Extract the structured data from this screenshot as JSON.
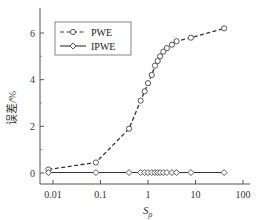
{
  "chart_data": {
    "type": "line",
    "title": "",
    "xlabel": "S_ρ",
    "xlabel_main": "S",
    "xlabel_sub": "ρ",
    "ylabel": "误差/%",
    "xscale": "log",
    "xlim": [
      0.006,
      100
    ],
    "ylim": [
      -0.4,
      7.0
    ],
    "x_ticks": [
      0.01,
      0.1,
      1,
      10,
      100
    ],
    "x_tick_labels": [
      "0.01",
      "0.1",
      "1",
      "10",
      "100"
    ],
    "y_ticks": [
      0,
      2,
      4,
      6
    ],
    "y_tick_labels": [
      "0",
      "2",
      "4",
      "6"
    ],
    "grid": false,
    "legend_position": "upper left",
    "series": [
      {
        "name": "PWE",
        "style": "dashed",
        "marker": "circle-open",
        "x": [
          0.008,
          0.08,
          0.4,
          0.7,
          0.85,
          1.0,
          1.2,
          1.4,
          1.6,
          1.8,
          2.1,
          2.5,
          3.2,
          4.0,
          8.0,
          40
        ],
        "y": [
          0.15,
          0.45,
          1.9,
          3.1,
          3.5,
          3.85,
          4.2,
          4.6,
          4.8,
          5.0,
          5.2,
          5.35,
          5.5,
          5.65,
          5.8,
          6.2
        ]
      },
      {
        "name": "IPWE",
        "style": "solid",
        "marker": "diamond-open",
        "x": [
          0.008,
          0.08,
          0.4,
          0.7,
          0.85,
          1.0,
          1.2,
          1.4,
          1.6,
          1.8,
          2.1,
          2.5,
          3.2,
          4.0,
          8.0,
          40
        ],
        "y": [
          0.02,
          0.02,
          0.02,
          0.02,
          0.02,
          0.02,
          0.02,
          0.02,
          0.02,
          0.02,
          0.02,
          0.02,
          0.02,
          0.02,
          0.02,
          0.02
        ]
      }
    ]
  },
  "legend": {
    "items": [
      {
        "label": "PWE"
      },
      {
        "label": "IPWE"
      }
    ]
  },
  "axes": {
    "y_title": "误差/%",
    "x_title_main": "S",
    "x_title_sub": "ρ"
  }
}
